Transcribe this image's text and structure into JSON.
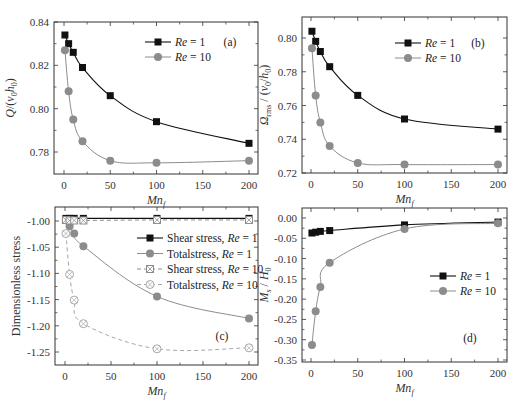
{
  "figure": {
    "colors": {
      "re1": "#111111",
      "re10": "#8c8c8c",
      "re10_open": "#a8a8a8",
      "frame": "#333333"
    }
  },
  "chart_data": [
    {
      "id": "a",
      "type": "line",
      "panel_label": "(a)",
      "title": "",
      "xlabel": "Mn_f",
      "ylabel": "Q/(v0 h0)",
      "xlim": [
        -7,
        207
      ],
      "ylim": [
        0.7695,
        0.84
      ],
      "xticks": [
        0,
        50,
        100,
        150,
        200
      ],
      "yticks": [
        0.78,
        0.8,
        0.82,
        0.84
      ],
      "ytick_labels": [
        "0.78",
        "0.80",
        "0.82",
        "0.84"
      ],
      "x": [
        1,
        5,
        10,
        20,
        50,
        100,
        200
      ],
      "series": [
        {
          "name": "Re = 1",
          "marker": "square",
          "values": [
            0.834,
            0.83,
            0.826,
            0.819,
            0.806,
            0.794,
            0.784
          ]
        },
        {
          "name": "Re = 10",
          "marker": "circle",
          "values": [
            0.827,
            0.808,
            0.795,
            0.785,
            0.776,
            0.775,
            0.776
          ]
        }
      ],
      "legend": [
        "Re = 1",
        "Re = 10"
      ],
      "legend_position": "upper right",
      "grid": false
    },
    {
      "id": "b",
      "type": "line",
      "panel_label": "(b)",
      "title": "",
      "xlabel": "Mn_f",
      "ylabel": "Ωrms / (v0/h0)",
      "xlim": [
        -7,
        207
      ],
      "ylim": [
        0.72,
        0.81
      ],
      "xticks": [
        0,
        50,
        100,
        150,
        200
      ],
      "yticks": [
        0.72,
        0.74,
        0.76,
        0.78,
        0.8
      ],
      "ytick_labels": [
        "0.72",
        "0.74",
        "0.76",
        "0.78",
        "0.80"
      ],
      "x": [
        1,
        5,
        10,
        20,
        50,
        100,
        200
      ],
      "series": [
        {
          "name": "Re = 1",
          "marker": "square",
          "values": [
            0.804,
            0.798,
            0.792,
            0.783,
            0.766,
            0.752,
            0.746
          ]
        },
        {
          "name": "Re = 10",
          "marker": "circle",
          "values": [
            0.794,
            0.766,
            0.75,
            0.736,
            0.726,
            0.725,
            0.725
          ]
        }
      ],
      "legend": [
        "Re = 1",
        "Re = 10"
      ],
      "legend_position": "upper right",
      "grid": false
    },
    {
      "id": "c",
      "type": "line",
      "panel_label": "(c)",
      "title": "",
      "xlabel": "Mn_f",
      "ylabel": "Dimensionless stress",
      "xlim": [
        -7,
        207
      ],
      "ylim": [
        -1.275,
        -0.975
      ],
      "xticks": [
        0,
        50,
        100,
        150,
        200
      ],
      "yticks": [
        -1.25,
        -1.2,
        -1.15,
        -1.1,
        -1.05,
        -1.0
      ],
      "ytick_labels": [
        "-1.25",
        "-1.20",
        "-1.15",
        "-1.10",
        "-1.05",
        "-1.00"
      ],
      "x": [
        1,
        5,
        10,
        20,
        100,
        200
      ],
      "series": [
        {
          "name": "Shear stress, Re = 1",
          "marker": "square",
          "line": "solid",
          "values": [
            -0.995,
            -0.995,
            -0.995,
            -0.995,
            -0.995,
            -0.995
          ]
        },
        {
          "name": "Totalstress, Re = 1",
          "marker": "circle",
          "line": "solid",
          "values": [
            -0.998,
            -1.01,
            -1.024,
            -1.048,
            -1.144,
            -1.186
          ]
        },
        {
          "name": "Shear stress, Re = 10",
          "marker": "open-square",
          "line": "dashed",
          "values": [
            -0.998,
            -0.999,
            -0.999,
            -0.999,
            -0.998,
            -0.998
          ]
        },
        {
          "name": "Totalstress, Re = 10",
          "marker": "open-circle",
          "line": "dashed",
          "values": [
            -1.024,
            -1.102,
            -1.151,
            -1.196,
            -1.244,
            -1.242
          ]
        }
      ],
      "legend": [
        "Shear stress, Re = 1",
        "Totalstress, Re = 1",
        "Shear stress, Re = 10",
        "Totalstress, Re = 10"
      ],
      "legend_position": "upper right",
      "grid": false
    },
    {
      "id": "d",
      "type": "line",
      "panel_label": "(d)",
      "title": "",
      "xlabel": "Mn_f",
      "ylabel": "Ms / H0",
      "xlim": [
        -7,
        207
      ],
      "ylim": [
        -0.35,
        0.02
      ],
      "xticks": [
        0,
        50,
        100,
        150,
        200
      ],
      "yticks": [
        -0.35,
        -0.3,
        -0.25,
        -0.2,
        -0.15,
        -0.1,
        -0.05,
        0.0
      ],
      "ytick_labels": [
        "-0.35",
        "-0.30",
        "-0.25",
        "-0.20",
        "-0.15",
        "-0.10",
        "-0.05",
        "0.00"
      ],
      "x": [
        1,
        5,
        10,
        20,
        100,
        200
      ],
      "series": [
        {
          "name": "Re = 1",
          "marker": "square",
          "values": [
            -0.037,
            -0.035,
            -0.033,
            -0.031,
            -0.017,
            -0.01
          ]
        },
        {
          "name": "Re = 10",
          "marker": "circle",
          "values": [
            -0.313,
            -0.23,
            -0.17,
            -0.11,
            -0.027,
            -0.013
          ]
        }
      ],
      "legend": [
        "Re = 1",
        "Re = 10"
      ],
      "legend_position": "center right",
      "grid": false
    }
  ]
}
